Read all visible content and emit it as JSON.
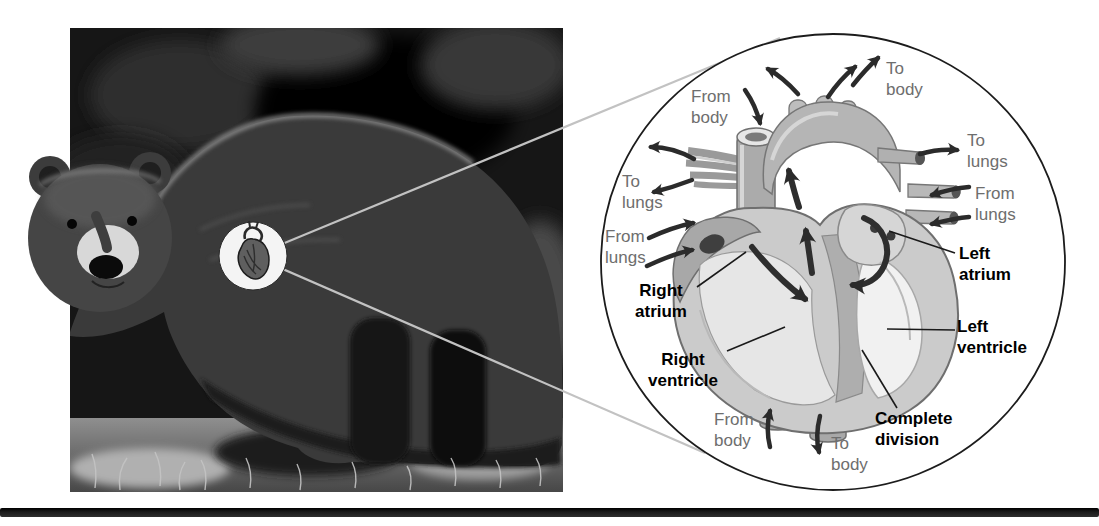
{
  "figure": {
    "photo_alt": "Grizzly bear standing in grass",
    "labels": [
      {
        "name": "from-body-top",
        "kind": "flow",
        "lines": [
          "From",
          "body"
        ]
      },
      {
        "name": "to-body-top",
        "kind": "flow",
        "lines": [
          "To",
          "body"
        ]
      },
      {
        "name": "to-lungs-left",
        "kind": "flow",
        "lines": [
          "To",
          "lungs"
        ]
      },
      {
        "name": "from-lungs-left",
        "kind": "flow",
        "lines": [
          "From",
          "lungs"
        ]
      },
      {
        "name": "to-lungs-right",
        "kind": "flow",
        "lines": [
          "To",
          "lungs"
        ]
      },
      {
        "name": "from-lungs-right",
        "kind": "flow",
        "lines": [
          "From",
          "lungs"
        ]
      },
      {
        "name": "from-body-bottom",
        "kind": "flow",
        "lines": [
          "From",
          "body"
        ]
      },
      {
        "name": "to-body-bottom",
        "kind": "flow",
        "lines": [
          "To",
          "body"
        ]
      },
      {
        "name": "right-atrium",
        "kind": "part",
        "lines": [
          "Right",
          "atrium"
        ]
      },
      {
        "name": "right-ventricle",
        "kind": "part",
        "lines": [
          "Right",
          "ventricle"
        ]
      },
      {
        "name": "left-atrium",
        "kind": "part",
        "lines": [
          "Left",
          "atrium"
        ]
      },
      {
        "name": "left-ventricle",
        "kind": "part",
        "lines": [
          "Left",
          "ventricle"
        ]
      },
      {
        "name": "complete-division",
        "kind": "part",
        "lines": [
          "Complete",
          "division"
        ]
      }
    ],
    "colors": {
      "background": "#ffffff",
      "flow_label": "#6e6e6e",
      "part_label": "#000000",
      "arrow": "#2b2b2b",
      "circle_outline": "#1c1c1c",
      "bottom_rule": "#1c1c1c"
    }
  }
}
